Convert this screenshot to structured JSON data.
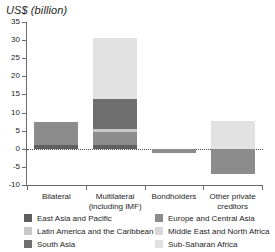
{
  "chart_data": {
    "type": "bar",
    "stacked": true,
    "orientation": "vertical",
    "title": "US$ (billion)",
    "xlabel": "",
    "ylabel": "US$ (billion)",
    "ylim": [
      -10,
      35
    ],
    "ytick_step": 5,
    "yticks": [
      "35",
      "30",
      "25",
      "20",
      "15",
      "10",
      "5",
      "0",
      "-5",
      "-10"
    ],
    "ytick_values": [
      35,
      30,
      25,
      20,
      15,
      10,
      5,
      0,
      -5,
      -10
    ],
    "grid": false,
    "zero_line": "dotted",
    "legend_position": "bottom",
    "legend_columns": 2,
    "categories": [
      "Bilateral",
      "Multilateral (including IMF)",
      "Bondholders",
      "Other private creditors"
    ],
    "category_labels_wrapped": [
      [
        "Bilateral"
      ],
      [
        "Multilateral",
        "(including IMF)"
      ],
      [
        "Bondholders"
      ],
      [
        "Other private",
        "creditors"
      ]
    ],
    "series": [
      {
        "name": "East Asia and Pacific",
        "color": "#5e5e5e",
        "values": [
          1.0,
          1.0,
          0.0,
          0.0
        ]
      },
      {
        "name": "Europe and Central Asia",
        "color": "#8c8c8c",
        "values": [
          6.5,
          3.5,
          -1.2,
          -7.1
        ]
      },
      {
        "name": "Latin America and the Caribbean",
        "color": "#c8c8c8",
        "values": [
          0.0,
          1.0,
          0.0,
          0.0
        ]
      },
      {
        "name": "Middle East and North Africa",
        "color": "#d8d8d8",
        "values": [
          0.0,
          0.0,
          0.0,
          0.0
        ]
      },
      {
        "name": "South Asia",
        "color": "#6f6f6f",
        "values": [
          0.0,
          8.3,
          0.0,
          0.0
        ]
      },
      {
        "name": "Sub-Saharan Africa",
        "color": "#e2e2e2",
        "values": [
          0.0,
          16.7,
          0.0,
          7.7
        ]
      }
    ],
    "bar_totals_positive": [
      7.5,
      30.5,
      0.0,
      11.0
    ],
    "bar_totals_negative": [
      0.0,
      0.0,
      -1.2,
      -3.8
    ]
  },
  "legend": {
    "left_column": [
      {
        "label": "East Asia and Pacific",
        "color": "#5e5e5e"
      },
      {
        "label": "Latin America and the Caribbean",
        "color": "#c8c8c8"
      },
      {
        "label": "South Asia",
        "color": "#6f6f6f"
      }
    ],
    "right_column": [
      {
        "label": "Europe and Central Asia",
        "color": "#8c8c8c"
      },
      {
        "label": "Middle East and North Africa",
        "color": "#d8d8d8"
      },
      {
        "label": "Sub-Saharan Africa",
        "color": "#e2e2e2"
      }
    ]
  },
  "style": {
    "axis_color": "#6b6b6b",
    "text_color": "#1e1e1e",
    "background": "#ffffff"
  }
}
